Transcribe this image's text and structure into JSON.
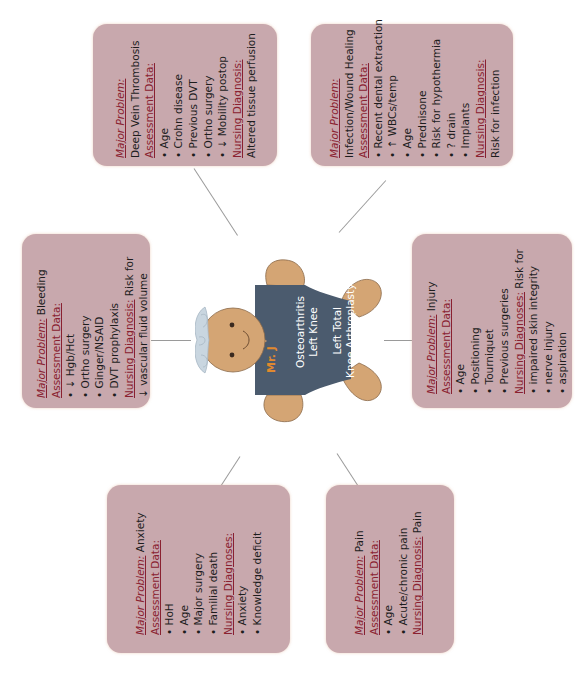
{
  "center": {
    "name": "Mr. J",
    "diagnosis": "Osteoarthritis Left Knee",
    "diagnosis_lines": [
      "Osteoarthritis",
      "Left Knee"
    ],
    "procedure_lines": [
      "Left Total",
      "Knee Arthroplasty"
    ],
    "colors": {
      "skin": "#d4a574",
      "shirt": "#4b5b6e",
      "hair": "#c9d6e0",
      "name": "#e0892e",
      "text": "#ffffff"
    }
  },
  "colors": {
    "box": "#c8a8ad",
    "heading": "#8a2130",
    "connector": "#9a9a9a"
  },
  "boxes": [
    {
      "id": "dvt",
      "major_problem_label": "Major Problem:",
      "major_problem": "Deep Vein Thrombosis",
      "assessment_label": "Assessment Data:",
      "assessment": [
        "• Age",
        "• Crohn disease",
        "• Previous DVT",
        "• Ortho surgery",
        "• ↓ Mobility postop"
      ],
      "nursing_label": "Nursing Diagnosis:",
      "nursing": "Altered tissue perfusion"
    },
    {
      "id": "infection",
      "major_problem_label": "Major Problem:",
      "major_problem": "Infection/Wound Healing",
      "assessment_label": "Assessment Data:",
      "assessment": [
        "• Recent dental extraction",
        "• ↑ WBCs/temp",
        "• Age",
        "• Prednisone",
        "• Risk for hypothermia",
        "• ? drain",
        "• Implants"
      ],
      "nursing_label": "Nursing Diagnosis:",
      "nursing": "Risk for infection"
    },
    {
      "id": "bleeding",
      "major_problem_label": "Major Problem:",
      "major_problem": "Bleeding",
      "assessment_label": "Assessment Data:",
      "assessment": [
        "• ↓ Hgb/Hct",
        "• Ortho surgery",
        "• Ginger/NSAID",
        "• DVT prophylaxis"
      ],
      "nursing_label": "Nursing Diagnosis:",
      "nursing": "Risk for",
      "nursing_cont": "↓ vascular fluid volume"
    },
    {
      "id": "injury",
      "major_problem_label": "Major Problem:",
      "major_problem": "Injury",
      "assessment_label": "Assessment Data:",
      "assessment": [
        "• Age",
        "• Positioning",
        "• Tourniquet",
        "• Previous surgeries"
      ],
      "nursing_label": "Nursing Diagnoses:",
      "nursing": "Risk for",
      "nursing_items": [
        "• impaired skin integrity",
        "• nerve injury",
        "• aspiration"
      ]
    },
    {
      "id": "anxiety",
      "major_problem_label": "Major Problem:",
      "major_problem": "Anxiety",
      "assessment_label": "Assessment Data:",
      "assessment": [
        "• HoH",
        "• Age",
        "• Major surgery",
        "• Familial death"
      ],
      "nursing_label": "Nursing Diagnoses:",
      "nursing_items": [
        "• Anxiety",
        "• Knowledge deficit"
      ]
    },
    {
      "id": "pain",
      "major_problem_label": "Major Problem:",
      "major_problem": "Pain",
      "assessment_label": "Assessment Data:",
      "assessment": [
        "• Age",
        "• Acute/chronic pain"
      ],
      "nursing_label": "Nursing Diagnosis:",
      "nursing": "Pain"
    }
  ]
}
